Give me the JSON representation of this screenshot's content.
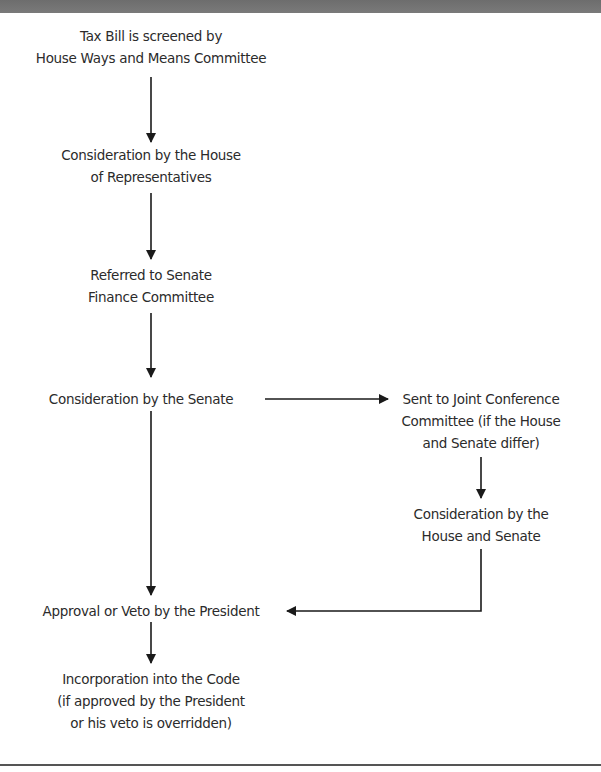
{
  "diagram": {
    "type": "flowchart",
    "nodes": [
      {
        "id": "n1",
        "lines": [
          "Tax Bill is screened by",
          "House Ways and Means Committee"
        ]
      },
      {
        "id": "n2",
        "lines": [
          "Consideration by the House",
          "of Representatives"
        ]
      },
      {
        "id": "n3",
        "lines": [
          "Referred to Senate",
          "Finance Committee"
        ]
      },
      {
        "id": "n4",
        "lines": [
          "Consideration by the Senate"
        ]
      },
      {
        "id": "n5",
        "lines": [
          "Sent to Joint Conference",
          "Committee (if the House",
          "and Senate differ)"
        ]
      },
      {
        "id": "n6",
        "lines": [
          "Consideration by the",
          "House and Senate"
        ]
      },
      {
        "id": "n7",
        "lines": [
          "Approval or Veto by the President"
        ]
      },
      {
        "id": "n8",
        "lines": [
          "Incorporation into the Code",
          "(if approved by the President",
          "or his veto is overridden)"
        ]
      }
    ],
    "edges": [
      {
        "from": "n1",
        "to": "n2"
      },
      {
        "from": "n2",
        "to": "n3"
      },
      {
        "from": "n3",
        "to": "n4"
      },
      {
        "from": "n4",
        "to": "n5"
      },
      {
        "from": "n4",
        "to": "n7"
      },
      {
        "from": "n5",
        "to": "n6"
      },
      {
        "from": "n6",
        "to": "n7"
      },
      {
        "from": "n7",
        "to": "n8"
      }
    ],
    "colors": {
      "text": "#2b2b2b",
      "lines": "#1a1a1a",
      "top_bar": "#727272",
      "bottom_rule": "#555555"
    }
  }
}
